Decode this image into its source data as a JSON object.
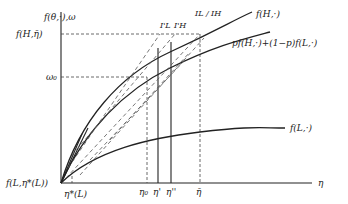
{
  "axes": {
    "y_label": "f(θ,·),ω",
    "x_label": "η"
  },
  "y_ticks": {
    "f_H_etabar": "f(H,η̄)",
    "omega0": "ω₀",
    "origin": "f(L,η*(L))"
  },
  "x_ticks": {
    "eta_star_L": "η*(L)",
    "eta0": "η₀",
    "eta_prime": "η'",
    "eta_dprime": "η''",
    "eta_bar": "η̄"
  },
  "curves": {
    "fH": "f(H,·)",
    "mix": "pf(H,·)+(1−p)f(L,·)",
    "fL": "f(L,·)"
  },
  "iso_labels": {
    "IL_prime": "I'L",
    "IH_prime": "I'H",
    "IL": "IL",
    "IH": "IH",
    "sep": "/"
  }
}
